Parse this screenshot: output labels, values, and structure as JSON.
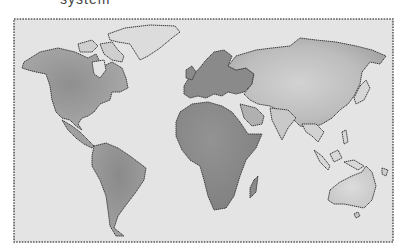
{
  "caption": {
    "text": "system"
  },
  "map": {
    "title": "World map",
    "style": "hand-drawn watercolor, grayscale",
    "colors": {
      "ocean": "#e3e3e3",
      "land_light": "#c9c9c9",
      "land_mid": "#a8a8a8",
      "land_dark": "#8e8e8e",
      "outline": "#3c3c3c",
      "frame": "#5a5a5a",
      "background": "#ffffff"
    },
    "regions": [
      {
        "name": "North America"
      },
      {
        "name": "Greenland"
      },
      {
        "name": "South America"
      },
      {
        "name": "Europe"
      },
      {
        "name": "Africa"
      },
      {
        "name": "Madagascar"
      },
      {
        "name": "Asia"
      },
      {
        "name": "Arabian Peninsula"
      },
      {
        "name": "India"
      },
      {
        "name": "Southeast Asia"
      },
      {
        "name": "Japan"
      },
      {
        "name": "Indonesia"
      },
      {
        "name": "Australia"
      },
      {
        "name": "New Zealand"
      }
    ]
  }
}
